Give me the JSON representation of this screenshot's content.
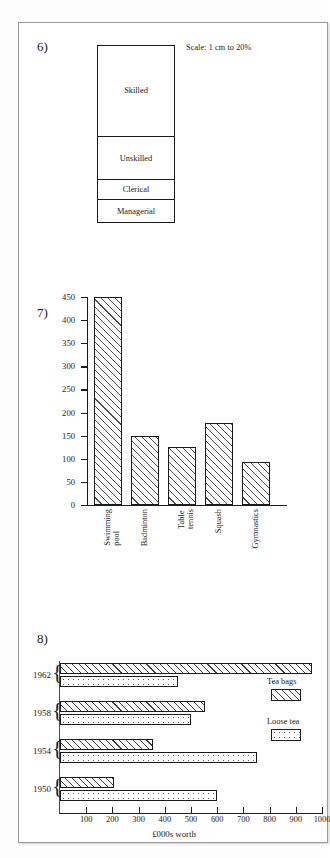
{
  "page": {
    "background": "#ffffff",
    "sheet_border": "#9a9a9a"
  },
  "questions": [
    {
      "number": "6)"
    },
    {
      "number": "7)"
    },
    {
      "number": "8)"
    }
  ],
  "q6": {
    "number": "6)",
    "scale_note": "Scale: 1 cm to 20%",
    "chart_data": {
      "type": "bar",
      "orientation": "vertical-stacked",
      "title": "",
      "xlabel": "",
      "ylabel": "",
      "scale": "1 cm to 20%",
      "categories": [
        "Skilled",
        "Unskilled",
        "Clerical",
        "Managerial"
      ],
      "segment_heights_px": [
        92,
        44,
        20,
        22
      ],
      "values": [
        null,
        null,
        null,
        null
      ],
      "grid": false,
      "legend": "none"
    },
    "segments": [
      {
        "label": "Skilled",
        "height_px": 92
      },
      {
        "label": "Unskilled",
        "height_px": 44
      },
      {
        "label": "Clerical",
        "height_px": 20
      },
      {
        "label": "Managerial",
        "height_px": 22
      }
    ]
  },
  "q7": {
    "number": "7)",
    "chart_data": {
      "type": "bar",
      "orientation": "vertical",
      "title": "",
      "xlabel": "",
      "ylabel": "",
      "categories": [
        "Swimming\npool",
        "Badminton",
        "Table\ntennis",
        "Squash",
        "Gymnastics"
      ],
      "values": [
        450,
        150,
        125,
        178,
        93
      ],
      "ylim": [
        0,
        450
      ],
      "yticks": [
        0,
        50,
        100,
        150,
        200,
        250,
        300,
        350,
        400,
        450
      ],
      "ytick_labels": [
        "0",
        "50",
        "100",
        "150",
        "200",
        "250",
        "300",
        "350",
        "400",
        "450"
      ],
      "grid": false,
      "legend": "none",
      "fill": "diagonal-hatch"
    }
  },
  "q8": {
    "number": "8)",
    "chart_data": {
      "type": "bar",
      "orientation": "horizontal-grouped",
      "title": "",
      "xlabel": "£000s worth",
      "ylabel": "",
      "categories": [
        "1962",
        "1958",
        "1954",
        "1950"
      ],
      "series": [
        {
          "name": "Tea bags",
          "fill": "diagonal-hatch",
          "values": [
            960,
            555,
            355,
            205
          ]
        },
        {
          "name": "Loose tea",
          "fill": "dots",
          "values": [
            450,
            500,
            750,
            600
          ]
        }
      ],
      "xlim": [
        0,
        1000
      ],
      "xticks": [
        100,
        200,
        300,
        400,
        500,
        600,
        700,
        800,
        900,
        1000
      ],
      "xtick_labels": [
        "100",
        "200",
        "300",
        "400",
        "500",
        "600",
        "700",
        "800",
        "900",
        "1000"
      ],
      "grid": false,
      "legend": "right"
    },
    "axis_title": "£000s worth",
    "legend": [
      {
        "label": "Tea bags",
        "fill": "diagonal-hatch"
      },
      {
        "label": "Loose tea",
        "fill": "dots"
      }
    ]
  }
}
